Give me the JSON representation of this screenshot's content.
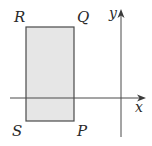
{
  "diagram": {
    "type": "coordinate-plane-with-rectangle",
    "rectangle": {
      "fill": "#e6e6e6",
      "stroke": "#4a4a4a",
      "vertices": {
        "R": "top-left",
        "Q": "top-right",
        "P": "bottom-right",
        "S": "bottom-left"
      },
      "labels": {
        "R": "R",
        "Q": "Q",
        "P": "P",
        "S": "S"
      }
    },
    "axes": {
      "x_label": "x",
      "y_label": "y",
      "color": "#4a4a4a"
    }
  }
}
